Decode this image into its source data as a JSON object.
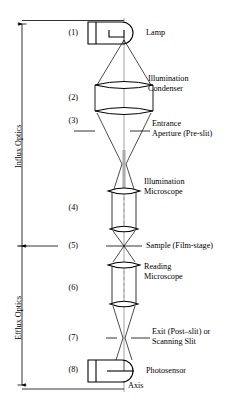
{
  "figure": {
    "axis_label": "Axis",
    "stroke_color": "#000000",
    "background_color": "#ffffff"
  },
  "brackets": [
    {
      "id": "influx",
      "label": "Influx Optics"
    },
    {
      "id": "efflux",
      "label": "Efflux Optics"
    }
  ],
  "stages": [
    {
      "number": "(1)",
      "label": "Lamp",
      "label_line1": "Lamp",
      "label_line2": ""
    },
    {
      "number": "(2)",
      "label": "Illumination Condenser",
      "label_line1": "Illumination",
      "label_line2": "Condenser"
    },
    {
      "number": "(3)",
      "label": "Entrance Aperture (Pre-slit)",
      "label_line1": "Entrance",
      "label_line2": "Aperture (Pre-slit)"
    },
    {
      "number": "(4)",
      "label": "Illumination Microscope",
      "label_line1": "Illumination",
      "label_line2": "Microscope"
    },
    {
      "number": "(5)",
      "label": "Sample (Film-stage)",
      "label_line1": "Sample (Film-stage)",
      "label_line2": ""
    },
    {
      "number": "(6)",
      "label": "Reading Microscope",
      "label_line1": "Reading",
      "label_line2": "Microscope"
    },
    {
      "number": "(7)",
      "label": "Exit (Post-slit) or Scanning Slit",
      "label_line1": "Exit (Post–slit) or",
      "label_line2": "Scanning Slit"
    },
    {
      "number": "(8)",
      "label": "Photosensor",
      "label_line1": "Photosensor",
      "label_line2": ""
    }
  ]
}
